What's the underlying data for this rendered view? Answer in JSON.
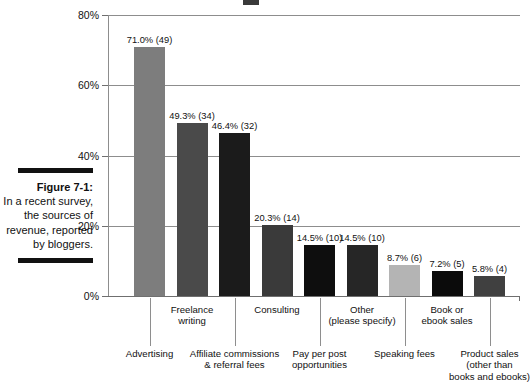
{
  "figure": {
    "caption_title": "Figure 7-1:",
    "caption_body": "In a recent survey, the sources of revenue, reported by bloggers."
  },
  "chart_data": {
    "type": "bar",
    "title": "",
    "xlabel": "",
    "ylabel": "",
    "ylim": [
      0,
      80
    ],
    "grid": true,
    "legend": "none",
    "ytick_labels": [
      "0%",
      "20%",
      "40%",
      "60%",
      "80%"
    ],
    "ytick_values": [
      0,
      20,
      40,
      60,
      80
    ],
    "categories": [
      "Advertising",
      "Freelance writing",
      "Affiliate commissions & referral fees",
      "Consulting",
      "Pay per post opportunities",
      "Other (please specify)",
      "Speaking fees",
      "Book or ebook sales",
      "Product sales (other than books and ebooks)"
    ],
    "values": [
      71.0,
      49.3,
      46.4,
      20.3,
      14.5,
      14.5,
      8.7,
      7.2,
      5.8
    ],
    "counts": [
      49,
      34,
      32,
      14,
      10,
      10,
      6,
      5,
      4
    ],
    "data_labels": [
      "71.0% (49)",
      "49.3% (34)",
      "46.4% (32)",
      "20.3% (14)",
      "14.5% (10)",
      "14.5% (10)",
      "8.7% (6)",
      "7.2% (5)",
      "5.8% (4)"
    ],
    "bar_colors": [
      "#7d7d7d",
      "#4a4a4a",
      "#1b1b1b",
      "#3a3a3a",
      "#0e0e0e",
      "#262626",
      "#b4b4b4",
      "#0b0b0b",
      "#404040"
    ],
    "category_label_lines": [
      [
        "Advertising"
      ],
      [
        "Freelance",
        "writing"
      ],
      [
        "Affiliate commissions",
        "& referral fees"
      ],
      [
        "Consulting"
      ],
      [
        "Pay per post",
        "opportunities"
      ],
      [
        "Other",
        "(please specify)"
      ],
      [
        "Speaking fees"
      ],
      [
        "Book or",
        "ebook sales"
      ],
      [
        "Product sales",
        "(other than",
        "books and ebooks)"
      ]
    ]
  }
}
